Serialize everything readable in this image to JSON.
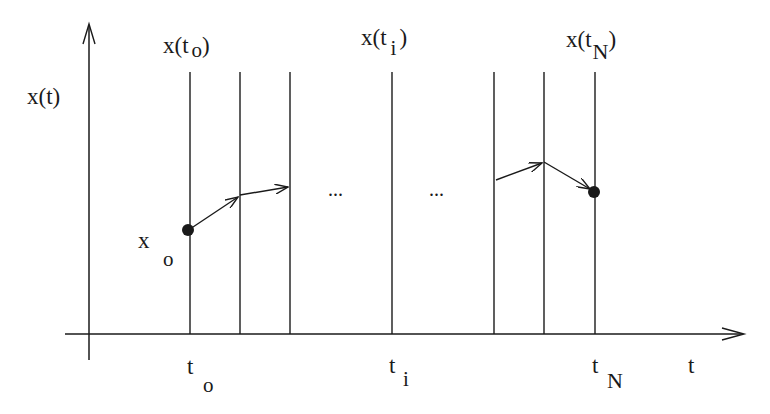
{
  "diagram": {
    "type": "trajectory-discretization",
    "y_axis_label": "x(t)",
    "x_axis_label": "t",
    "top_labels": [
      {
        "main": "x(t",
        "sub": "o",
        "close": ")"
      },
      {
        "main": "x(t",
        "sub": "i",
        "close": ")"
      },
      {
        "main": "x(t",
        "sub": "N",
        "close": ")"
      }
    ],
    "bottom_labels": [
      {
        "main": "t",
        "sub": "o"
      },
      {
        "main": "t",
        "sub": "i"
      },
      {
        "main": "t",
        "sub": "N"
      }
    ],
    "initial_state_label": {
      "main": "x",
      "sub": "o"
    },
    "ellipsis": [
      "...",
      "..."
    ],
    "stroke_color": "#1a1a1a"
  }
}
